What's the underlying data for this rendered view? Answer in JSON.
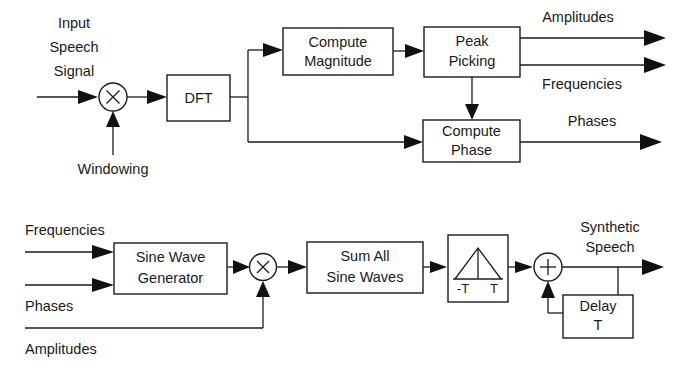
{
  "figure": {
    "background_color": "#ffffff",
    "line_color": "#1c1c1c",
    "text_color": "#1a1a1a"
  },
  "analysis": {
    "name": "analysis-stage",
    "input_label_line1": "Input",
    "input_label_line2": "Speech",
    "input_label_line3": "Signal",
    "windowing_label": "Windowing",
    "multiplier_symbol": "×",
    "blocks": {
      "dft": {
        "line1": "DFT",
        "line2": ""
      },
      "compute_magnitude": {
        "line1": "Compute",
        "line2": "Magnitude"
      },
      "peak_picking": {
        "line1": "Peak",
        "line2": "Picking"
      },
      "compute_phase": {
        "line1": "Compute",
        "line2": "Phase"
      }
    },
    "outputs": {
      "amplitudes": "Amplitudes",
      "frequencies": "Frequencies",
      "phases": "Phases"
    }
  },
  "synthesis": {
    "name": "synthesis-stage",
    "inputs": {
      "frequencies": "Frequencies",
      "phases": "Phases",
      "amplitudes": "Amplitudes"
    },
    "multiplier_symbol": "×",
    "summer_symbol": "+",
    "blocks": {
      "sine_wave_generator": {
        "line1": "Sine Wave",
        "line2": "Generator"
      },
      "sum_all_sine_waves": {
        "line1": "Sum All",
        "line2": "Sine Waves"
      },
      "overlap_window": {
        "left_tick": "-T",
        "right_tick": "T"
      },
      "delay": {
        "line1": "Delay",
        "line2": "T"
      }
    },
    "output_label_line1": "Synthetic",
    "output_label_line2": "Speech"
  }
}
